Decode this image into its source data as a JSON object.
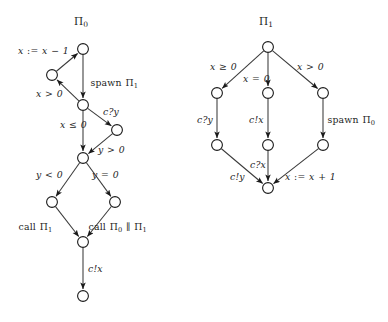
{
  "figure": {
    "kind": "control-flow-graph-pair",
    "background": "#ffffff",
    "ink_color": "#1d1d1d",
    "edge_color": "#3a3a3a",
    "width": 388,
    "height": 322
  },
  "graphs": [
    {
      "id": "pi0",
      "title": "Π",
      "title_sub": "0",
      "title_x": 83,
      "title_y": 22,
      "nodes": [
        {
          "id": "n0",
          "cx": 83,
          "cy": 49,
          "r": 5.4
        },
        {
          "id": "n1",
          "cx": 52,
          "cy": 75,
          "r": 5.4
        },
        {
          "id": "n2",
          "cx": 83,
          "cy": 105,
          "r": 5.4
        },
        {
          "id": "n3",
          "cx": 117,
          "cy": 130,
          "r": 5.4
        },
        {
          "id": "n4",
          "cx": 83,
          "cy": 158,
          "r": 5.4
        },
        {
          "id": "n5",
          "cx": 52,
          "cy": 202,
          "r": 5.4
        },
        {
          "id": "n6",
          "cx": 115,
          "cy": 202,
          "r": 5.4
        },
        {
          "id": "n7",
          "cx": 83,
          "cy": 242,
          "r": 5.4
        },
        {
          "id": "n8",
          "cx": 83,
          "cy": 296,
          "r": 5.4
        }
      ],
      "edges": [
        {
          "from": "n1",
          "to": "n0",
          "label": "x := x − 1"
        },
        {
          "from": "n0",
          "to": "n2",
          "label": "spawn Π₁"
        },
        {
          "from": "n2",
          "to": "n1",
          "label": "x > 0"
        },
        {
          "from": "n2",
          "to": "n3",
          "label": "c?y"
        },
        {
          "from": "n2",
          "to": "n4",
          "label": "x ≤ 0"
        },
        {
          "from": "n3",
          "to": "n4",
          "label": "y > 0"
        },
        {
          "from": "n4",
          "to": "n5",
          "label": "y < 0"
        },
        {
          "from": "n4",
          "to": "n6",
          "label": "y = 0"
        },
        {
          "from": "n5",
          "to": "n7",
          "label": "call Π₁"
        },
        {
          "from": "n6",
          "to": "n7",
          "label": "call Π₀ ∥ Π₁"
        },
        {
          "from": "n7",
          "to": "n8",
          "label": "c!x"
        }
      ],
      "labels": [
        {
          "id": "l-assign-dec",
          "text": "x := x − 1",
          "x": 18,
          "y": 46,
          "italic": true
        },
        {
          "id": "l-spawn-1",
          "text": "spawn Π₁",
          "x": 90,
          "y": 78,
          "italic": false
        },
        {
          "id": "l-xgt0",
          "text": "x > 0",
          "x": 36,
          "y": 89,
          "italic": true
        },
        {
          "id": "l-cqy",
          "text": "c?y",
          "x": 103,
          "y": 107,
          "italic": true
        },
        {
          "id": "l-xle0",
          "text": "x ≤ 0",
          "x": 60,
          "y": 120,
          "italic": true
        },
        {
          "id": "l-ygt0",
          "text": "y > 0",
          "x": 98,
          "y": 145,
          "italic": true
        },
        {
          "id": "l-ylt0",
          "text": "y < 0",
          "x": 36,
          "y": 170,
          "italic": true
        },
        {
          "id": "l-yeq0",
          "text": "y = 0",
          "x": 92,
          "y": 170,
          "italic": true
        },
        {
          "id": "l-call-1",
          "text": "call Π₁",
          "x": 18,
          "y": 222,
          "italic": false
        },
        {
          "id": "l-call-0-1",
          "text": "call Π₀ ∥ Π₁",
          "x": 88,
          "y": 222,
          "italic": false
        },
        {
          "id": "l-cbx",
          "text": "c!x",
          "x": 88,
          "y": 264,
          "italic": true
        }
      ]
    },
    {
      "id": "pi1",
      "title": "Π",
      "title_sub": "1",
      "title_x": 268,
      "title_y": 22,
      "nodes": [
        {
          "id": "m0",
          "cx": 268,
          "cy": 47,
          "r": 5.4
        },
        {
          "id": "m1",
          "cx": 217,
          "cy": 93,
          "r": 5.4
        },
        {
          "id": "m2",
          "cx": 268,
          "cy": 93,
          "r": 5.4
        },
        {
          "id": "m3",
          "cx": 323,
          "cy": 93,
          "r": 5.4
        },
        {
          "id": "m4",
          "cx": 217,
          "cy": 145,
          "r": 5.4
        },
        {
          "id": "m5",
          "cx": 268,
          "cy": 145,
          "r": 5.4
        },
        {
          "id": "m6",
          "cx": 323,
          "cy": 145,
          "r": 5.4
        },
        {
          "id": "m7",
          "cx": 268,
          "cy": 188,
          "r": 5.4
        }
      ],
      "edges": [
        {
          "from": "m0",
          "to": "m1",
          "label": "x ≥ 0"
        },
        {
          "from": "m0",
          "to": "m2",
          "label": "x = 0"
        },
        {
          "from": "m0",
          "to": "m3",
          "label": "x > 0"
        },
        {
          "from": "m1",
          "to": "m4",
          "label": "c?y"
        },
        {
          "from": "m2",
          "to": "m5",
          "label": "c!x"
        },
        {
          "from": "m3",
          "to": "m6",
          "label": "spawn Π₀"
        },
        {
          "from": "m4",
          "to": "m7",
          "label": "c!y"
        },
        {
          "from": "m5",
          "to": "m7",
          "label": "c?x"
        },
        {
          "from": "m6",
          "to": "m7",
          "label": "x := x + 1"
        }
      ],
      "labels": [
        {
          "id": "r-xge0",
          "text": "x ≥ 0",
          "x": 210,
          "y": 62,
          "italic": true
        },
        {
          "id": "r-xeq0",
          "text": "x = 0",
          "x": 243,
          "y": 74,
          "italic": true
        },
        {
          "id": "r-xgt0",
          "text": "x > 0",
          "x": 297,
          "y": 62,
          "italic": true
        },
        {
          "id": "r-cqy",
          "text": "c?y",
          "x": 197,
          "y": 115,
          "italic": true
        },
        {
          "id": "r-cbx",
          "text": "c!x",
          "x": 249,
          "y": 115,
          "italic": true
        },
        {
          "id": "r-spawn-0",
          "text": "spawn Π₀",
          "x": 327,
          "y": 115,
          "italic": false
        },
        {
          "id": "r-cby",
          "text": "c!y",
          "x": 230,
          "y": 172,
          "italic": true
        },
        {
          "id": "r-cqx",
          "text": "c?x",
          "x": 250,
          "y": 160,
          "italic": true
        },
        {
          "id": "r-incr",
          "text": "x := x + 1",
          "x": 285,
          "y": 172,
          "italic": true
        }
      ]
    }
  ]
}
